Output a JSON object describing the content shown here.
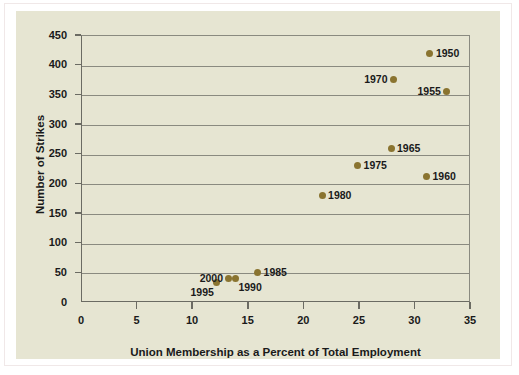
{
  "figure": {
    "background_color": "#ffffff",
    "panel_color": "#e6e5d2",
    "marker_color": "#8a7430",
    "axis_color": "#6b6b63"
  },
  "chart_data": {
    "type": "scatter",
    "title": "",
    "xlabel": "Union Membership as a Percent of Total Employment",
    "ylabel": "Number of Strikes",
    "xlim": [
      0,
      35
    ],
    "ylim": [
      0,
      450
    ],
    "xticks": [
      "0",
      "5",
      "10",
      "15",
      "20",
      "25",
      "30",
      "35"
    ],
    "xtick_values": [
      0,
      5,
      10,
      15,
      20,
      25,
      30,
      35
    ],
    "yticks": [
      "0",
      "50",
      "100",
      "150",
      "200",
      "250",
      "300",
      "350",
      "400",
      "450"
    ],
    "ytick_values": [
      0,
      50,
      100,
      150,
      200,
      250,
      300,
      350,
      400,
      450
    ],
    "grid": "horizontal",
    "legend": "none",
    "points": [
      {
        "label": "1950",
        "x": 31.3,
        "y": 420,
        "label_side": "right"
      },
      {
        "label": "1955",
        "x": 32.8,
        "y": 356,
        "label_side": "left"
      },
      {
        "label": "1960",
        "x": 31.0,
        "y": 214,
        "label_side": "right"
      },
      {
        "label": "1965",
        "x": 27.8,
        "y": 261,
        "label_side": "right"
      },
      {
        "label": "1970",
        "x": 28.0,
        "y": 376,
        "label_side": "left"
      },
      {
        "label": "1975",
        "x": 24.8,
        "y": 231,
        "label_side": "right"
      },
      {
        "label": "1980",
        "x": 21.6,
        "y": 182,
        "label_side": "right"
      },
      {
        "label": "1985",
        "x": 15.8,
        "y": 51,
        "label_side": "right"
      },
      {
        "label": "1990",
        "x": 13.8,
        "y": 42,
        "label_side": "below-right"
      },
      {
        "label": "1995",
        "x": 12.1,
        "y": 34,
        "label_side": "below-left"
      },
      {
        "label": "2000",
        "x": 13.2,
        "y": 42,
        "label_side": "left"
      }
    ]
  }
}
